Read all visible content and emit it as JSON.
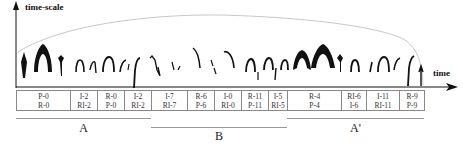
{
  "axes": {
    "y_label": "time-scale",
    "x_label": "time"
  },
  "segments": [
    {
      "top": "P-0",
      "bottom": "R-0",
      "width": 54
    },
    {
      "top": "I-2",
      "bottom": "RI-2",
      "width": 27
    },
    {
      "top": "R-0",
      "bottom": "P-0",
      "width": 27
    },
    {
      "top": "I-2",
      "bottom": "RI-2",
      "width": 27
    },
    {
      "top": "I-7",
      "bottom": "RI-7",
      "width": 36
    },
    {
      "top": "R-6",
      "bottom": "P-6",
      "width": 27
    },
    {
      "top": "I-0",
      "bottom": "RI-0",
      "width": 27
    },
    {
      "top": "R-11",
      "bottom": "P-11",
      "width": 27
    },
    {
      "top": "I-5",
      "bottom": "RI-5",
      "width": 19
    },
    {
      "top": "R-4",
      "bottom": "P-4",
      "width": 54
    },
    {
      "top": "RI-6",
      "bottom": "I-6",
      "width": 25
    },
    {
      "top": "I-11",
      "bottom": "RI-11",
      "width": 33
    },
    {
      "top": "R-9",
      "bottom": "P-9",
      "width": 25
    }
  ],
  "sections": [
    {
      "label": "A",
      "x1": 16,
      "x2": 151,
      "y": 118,
      "label_y": 122
    },
    {
      "label": "B",
      "x1": 151,
      "x2": 287,
      "y": 127,
      "label_y": 130
    },
    {
      "label": "A'",
      "x1": 287,
      "x2": 424,
      "y": 118,
      "label_y": 122
    }
  ]
}
